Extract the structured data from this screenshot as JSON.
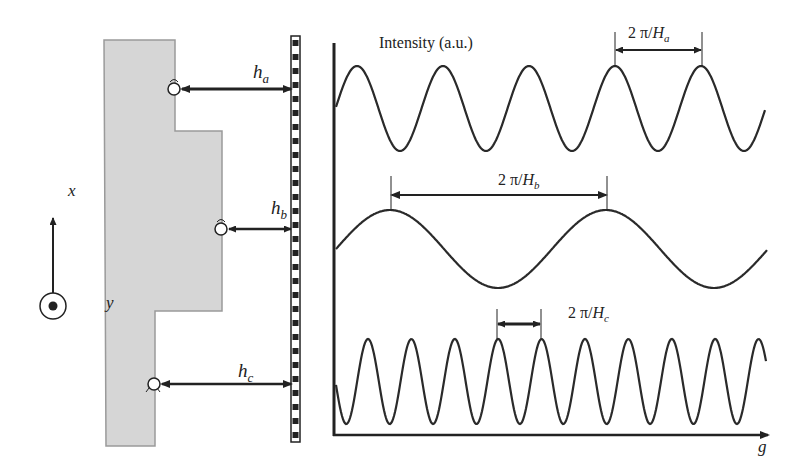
{
  "figure": {
    "left_panel": {
      "axis_labels": {
        "x": "x",
        "y": "y"
      },
      "distances": [
        {
          "var": "h",
          "sub": "a"
        },
        {
          "var": "h",
          "sub": "b"
        },
        {
          "var": "h",
          "sub": "c"
        }
      ],
      "colors": {
        "block_fill": "#d6d6d6",
        "block_stroke": "#9a9a9a",
        "ink": "#222222"
      }
    },
    "right_panel": {
      "ylabel": "Intensity (a.u.)",
      "xlabel": "g",
      "period_labels": [
        {
          "prefix": "2 π/",
          "var": "H",
          "sub": "a"
        },
        {
          "prefix": "2 π/",
          "var": "H",
          "sub": "b"
        },
        {
          "prefix": "2 π/",
          "var": "H",
          "sub": "c"
        }
      ]
    }
  },
  "chart_data": {
    "type": "line",
    "title": "",
    "xlabel": "g",
    "ylabel": "Intensity (a.u.)",
    "grid": false,
    "series": [
      {
        "name": "H_a",
        "period_px": 86,
        "cycles_shown": 5,
        "annotation": "2 π/H_a"
      },
      {
        "name": "H_b",
        "period_px": 216,
        "cycles_shown": 2,
        "annotation": "2 π/H_b"
      },
      {
        "name": "H_c",
        "period_px": 43.4,
        "cycles_shown": 10,
        "annotation": "2 π/H_c"
      }
    ]
  }
}
